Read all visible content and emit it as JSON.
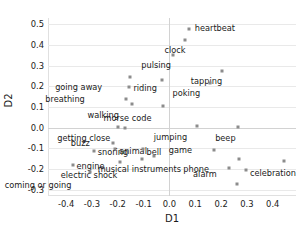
{
  "chart_data": {
    "type": "scatter",
    "title": "",
    "xlabel": "D1",
    "ylabel": "D2",
    "xlim": [
      -0.47,
      0.49
    ],
    "ylim": [
      -0.33,
      0.53
    ],
    "grid": true,
    "legend": "none",
    "xticks": [
      "-0.4",
      "-0.3",
      "-0.2",
      "-0.1",
      "0.0",
      "0.1",
      "0.2",
      "0.3",
      "0.4"
    ],
    "xtick_values": [
      -0.4,
      -0.3,
      -0.2,
      -0.1,
      0.0,
      0.1,
      0.2,
      0.3,
      0.4
    ],
    "yticks": [
      "0.5",
      "0.4",
      "0.3",
      "0.2",
      "0.1",
      "0.0",
      "-0.1",
      "-0.2",
      "-0.3"
    ],
    "ytick_values": [
      0.5,
      0.4,
      0.3,
      0.2,
      0.1,
      0.0,
      -0.1,
      -0.2,
      -0.3
    ],
    "marker_color": "#8c8c8c",
    "points": [
      {
        "label": "heartbeat",
        "x": 0.075,
        "y": 0.475,
        "label_dx": 6,
        "label_dy": -1
      },
      {
        "label": "clock",
        "x": 0.062,
        "y": 0.425,
        "label_dx": -4,
        "label_dy": 10
      },
      {
        "label": "pulsing",
        "x": 0.015,
        "y": 0.352,
        "label_dx": -6,
        "label_dy": 10
      },
      {
        "label": "tapping",
        "x": 0.203,
        "y": 0.272,
        "label_dx": -4,
        "label_dy": 10
      },
      {
        "label": "going away",
        "x": -0.152,
        "y": 0.247,
        "label_dx": -32,
        "label_dy": 10
      },
      {
        "label": "riding",
        "x": -0.155,
        "y": 0.196,
        "label_dx": 4,
        "label_dy": 1
      },
      {
        "label": "poking",
        "x": 0.159,
        "y": 0.215,
        "label_dx": -14,
        "label_dy": 10
      },
      {
        "label": "breathing",
        "x": -0.167,
        "y": 0.139,
        "label_dx": -45,
        "label_dy": 0
      },
      {
        "label": "walking",
        "x": -0.143,
        "y": 0.116,
        "label_dx": -18,
        "label_dy": 11
      },
      {
        "label": "morse code",
        "x": -0.023,
        "y": 0.105,
        "label_dx": -16,
        "label_dy": 12
      },
      {
        "label": "unlabeled-upper-left",
        "x": -0.027,
        "y": 0.23,
        "label_dx": 0,
        "label_dy": 0,
        "hide_label": true
      },
      {
        "label": "getting close",
        "x": -0.198,
        "y": 0.005,
        "label_dx": -12,
        "label_dy": 11
      },
      {
        "label": "jumping",
        "x": 0.106,
        "y": 0.007,
        "label_dx": -14,
        "label_dy": 11
      },
      {
        "label": "beep",
        "x": 0.266,
        "y": 0.003,
        "label_dx": -7,
        "label_dy": 11
      },
      {
        "label": "unlabeled-near-getting-close",
        "x": -0.172,
        "y": -0.001,
        "label_dx": 0,
        "label_dy": 0,
        "hide_label": true
      },
      {
        "label": "buzz",
        "x": -0.219,
        "y": -0.072,
        "label_dx": -27,
        "label_dy": 0
      },
      {
        "label": "animal",
        "x": -0.21,
        "y": -0.105,
        "label_dx": 4,
        "label_dy": 2
      },
      {
        "label": "snoring",
        "x": -0.293,
        "y": -0.112,
        "label_dx": 4,
        "label_dy": 1
      },
      {
        "label": "bell",
        "x": -0.104,
        "y": -0.103,
        "label_dx": 4,
        "label_dy": 3
      },
      {
        "label": "game",
        "x": 0.172,
        "y": -0.11,
        "label_dx": -26,
        "label_dy": 0
      },
      {
        "label": "engine",
        "x": -0.375,
        "y": -0.178,
        "label_dx": 4,
        "label_dy": 1
      },
      {
        "label": "electric shock",
        "x": -0.192,
        "y": -0.167,
        "label_dx": -6,
        "label_dy": 13
      },
      {
        "label": "unlabeled-bell-lower",
        "x": -0.108,
        "y": -0.152,
        "label_dx": 0,
        "label_dy": 0,
        "hide_label": true
      },
      {
        "label": "unlabeled-mid-lower",
        "x": -0.058,
        "y": -0.135,
        "label_dx": 0,
        "label_dy": 0,
        "hide_label": true
      },
      {
        "label": "musical instruments",
        "x": 0.268,
        "y": -0.153,
        "label_dx": -62,
        "label_dy": 10
      },
      {
        "label": "phone",
        "x": 0.232,
        "y": -0.195,
        "label_dx": -24,
        "label_dy": 1
      },
      {
        "label": "celebration",
        "x": 0.296,
        "y": -0.205,
        "label_dx": 4,
        "label_dy": 3
      },
      {
        "label": "alarm",
        "x": 0.262,
        "y": -0.272,
        "label_dx": -24,
        "label_dy": -10
      },
      {
        "label": "unlabeled-far-right",
        "x": 0.443,
        "y": -0.163,
        "label_dx": 0,
        "label_dy": 0,
        "hide_label": true
      },
      {
        "label": "coming or going",
        "x": -0.308,
        "y": -0.215,
        "label_dx": -22,
        "label_dy": 13
      }
    ]
  }
}
